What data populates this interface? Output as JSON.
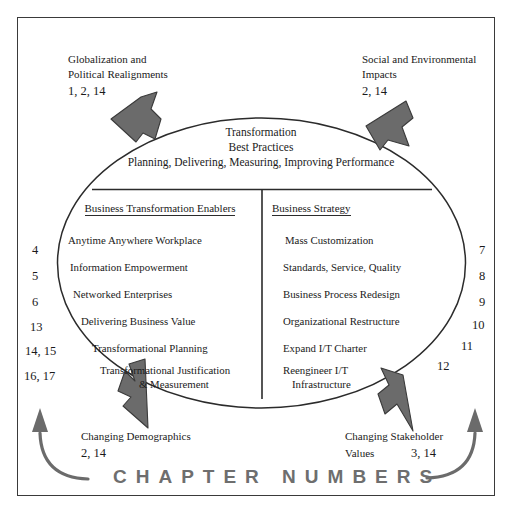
{
  "diagram": {
    "frame": {
      "border_color": "#3a3a3a"
    },
    "center": {
      "title_line1": "Transformation",
      "title_line2": "Best Practices",
      "title_line3": "Planning, Delivering, Measuring, Improving Performance"
    },
    "columns": [
      {
        "header": "Business Transformation Enablers",
        "items": [
          "Anytime Anywhere Workplace",
          "Information Empowerment",
          "Networked Enterprises",
          "Delivering Business Value",
          "Transformational Planning",
          "Transformational Justification",
          "& Measurement"
        ]
      },
      {
        "header": "Business Strategy",
        "items": [
          "Mass Customization",
          "Standards, Service, Quality",
          "Business Process Redesign",
          "Organizational Restructure",
          "Expand I/T Charter",
          "Reengineer I/T",
          "Infrastructure"
        ]
      }
    ],
    "callouts": {
      "top_left": {
        "line1": "Globalization and",
        "line2": "Political Realignments",
        "numbers": "1, 2, 14"
      },
      "top_right": {
        "line1": "Social and Environmental",
        "line2": "Impacts",
        "numbers": "2, 14"
      },
      "bottom_left": {
        "line1": "Changing Demographics",
        "line2": "",
        "numbers": "2, 14"
      },
      "bottom_right": {
        "line1": "Changing Stakeholder",
        "line2": "Values",
        "numbers": "3, 14"
      }
    },
    "left_numbers": [
      "4",
      "5",
      "6",
      "13",
      "14, 15",
      "16, 17"
    ],
    "right_numbers": [
      "7",
      "8",
      "9",
      "10",
      "11",
      "12"
    ],
    "footer": {
      "label": "CHAPTER NUMBERS",
      "color": "#6e6e6e"
    },
    "arrow_color": "#6b6b6b",
    "arrow_outline": "#3a3a3a"
  }
}
